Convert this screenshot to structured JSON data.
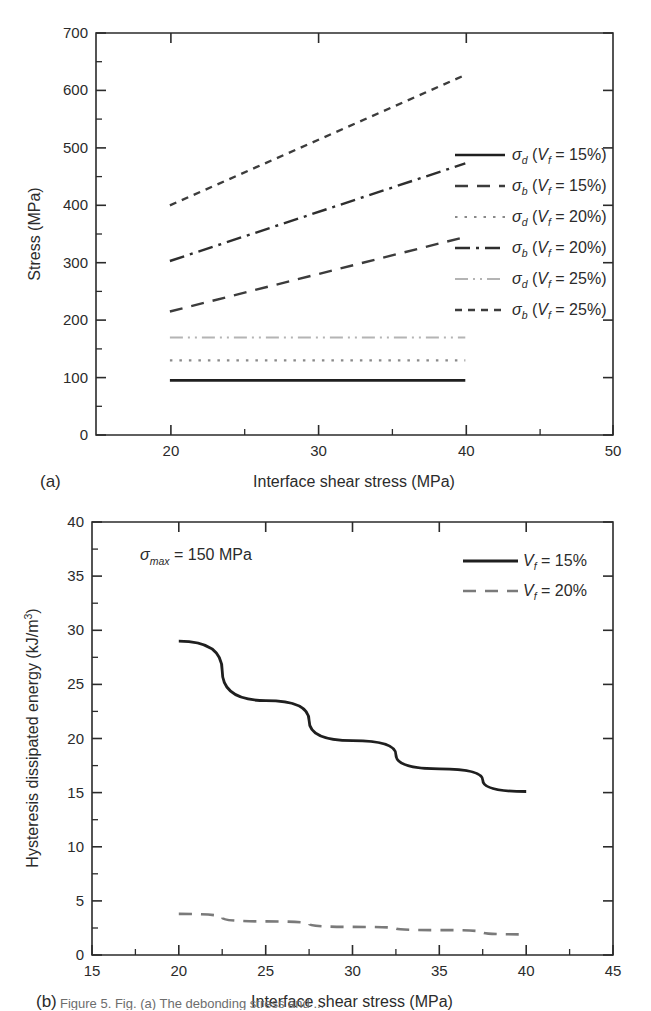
{
  "figure": {
    "panel_a_label": "(a)",
    "panel_b_label": "(b)",
    "caption_fragment": "Figure 5. Fig. (a) The debonding stress and ..."
  },
  "chart_data": [
    {
      "type": "line",
      "panel": "(a)",
      "title": "",
      "xlabel": "Interface shear stress (MPa)",
      "ylabel": "Stress (MPa)",
      "xlim": [
        15,
        50
      ],
      "ylim": [
        0,
        700
      ],
      "xticks": [
        20,
        30,
        40,
        50
      ],
      "xtick_labels": [
        "20",
        "30",
        "40",
        "50"
      ],
      "xminor": [
        25,
        35,
        45
      ],
      "yticks": [
        0,
        100,
        200,
        300,
        400,
        500,
        600,
        700
      ],
      "ytick_labels": [
        "0",
        "100",
        "200",
        "300",
        "400",
        "500",
        "600",
        "700"
      ],
      "yminor": [
        50,
        150,
        250,
        350,
        450,
        550,
        650
      ],
      "grid": false,
      "legend_position": "right-inside",
      "x": [
        20,
        40
      ],
      "series": [
        {
          "name": "sigma_d (Vf = 15%)",
          "style": "solid",
          "symbol": "σ",
          "subscript": "d",
          "param": "V",
          "param_sub": "f",
          "value": "15%",
          "label": "σd (Vf = 15%)",
          "values": [
            95,
            95
          ],
          "color": "#1f1f1f",
          "width": 2.6
        },
        {
          "name": "sigma_b (Vf = 15%)",
          "style": "dashed",
          "symbol": "σ",
          "subscript": "b",
          "param": "V",
          "param_sub": "f",
          "value": "15%",
          "label": "σb (Vf = 15%)",
          "values": [
            215,
            345
          ],
          "color": "#3c3c3c",
          "width": 2.4
        },
        {
          "name": "sigma_d (Vf = 20%)",
          "style": "dotted",
          "symbol": "σ",
          "subscript": "d",
          "param": "V",
          "param_sub": "f",
          "value": "20%",
          "label": "σd (Vf = 20%)",
          "values": [
            130,
            130
          ],
          "color": "#8a8a8a",
          "width": 2.2
        },
        {
          "name": "sigma_b (Vf = 20%)",
          "style": "dashdot",
          "symbol": "σ",
          "subscript": "b",
          "param": "V",
          "param_sub": "f",
          "value": "20%",
          "label": "σb (Vf = 20%)",
          "values": [
            303,
            473
          ],
          "color": "#2e2e2e",
          "width": 2.4
        },
        {
          "name": "sigma_d (Vf = 25%)",
          "style": "dashdotdot",
          "symbol": "σ",
          "subscript": "d",
          "param": "V",
          "param_sub": "f",
          "value": "25%",
          "label": "σd (Vf = 25%)",
          "values": [
            170,
            170
          ],
          "color": "#b4b4b4",
          "width": 2.0
        },
        {
          "name": "sigma_b (Vf = 25%)",
          "style": "shortdash",
          "symbol": "σ",
          "subscript": "b",
          "param": "V",
          "param_sub": "f",
          "value": "25%",
          "label": "σb (Vf = 25%)",
          "values": [
            400,
            627
          ],
          "color": "#3c3c3c",
          "width": 2.4
        }
      ]
    },
    {
      "type": "line",
      "panel": "(b)",
      "title": "",
      "annotation": "σmax = 150 MPa",
      "annotation_symbol": "σ",
      "annotation_sub": "max",
      "annotation_rest": "= 150 MPa",
      "xlabel": "Interface shear stress (MPa)",
      "ylabel": "Hysteresis dissipated energy (kJ/m3)",
      "ylabel_main": "Hysteresis dissipated energy (kJ/m",
      "ylabel_sup": "3",
      "ylabel_tail": ")",
      "xlim": [
        15,
        45
      ],
      "ylim": [
        0,
        40
      ],
      "xticks": [
        15,
        20,
        25,
        30,
        35,
        40,
        45
      ],
      "xtick_labels": [
        "15",
        "20",
        "25",
        "30",
        "35",
        "40",
        "45"
      ],
      "yticks": [
        0,
        5,
        10,
        15,
        20,
        25,
        30,
        35,
        40
      ],
      "ytick_labels": [
        "0",
        "5",
        "10",
        "15",
        "20",
        "25",
        "30",
        "35",
        "40"
      ],
      "grid": false,
      "legend_position": "top-right-inside",
      "x": [
        20,
        25,
        30,
        35,
        40
      ],
      "series": [
        {
          "name": "Vf = 15%",
          "style": "solid",
          "param": "V",
          "param_sub": "f",
          "value": "15%",
          "label": "Vf = 15%",
          "values": [
            29.0,
            23.5,
            19.8,
            17.2,
            15.1
          ],
          "color": "#1f1f1f",
          "width": 2.8
        },
        {
          "name": "Vf = 20%",
          "style": "dashed",
          "param": "V",
          "param_sub": "f",
          "value": "20%",
          "label": "Vf = 20%",
          "values": [
            3.8,
            3.1,
            2.6,
            2.3,
            1.9
          ],
          "color": "#7a7a7a",
          "width": 2.6
        }
      ]
    }
  ]
}
